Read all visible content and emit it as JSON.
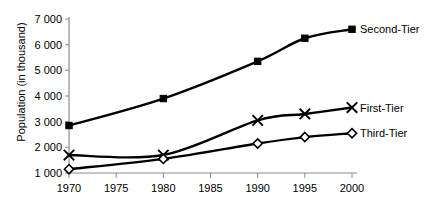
{
  "chart_data": {
    "type": "line",
    "title": "",
    "xlabel": "",
    "ylabel": "Population (in thousand)",
    "x": [
      1970,
      1975,
      1980,
      1985,
      1990,
      1995,
      2000
    ],
    "xticklabels": [
      "1970",
      "1975",
      "1980",
      "1985",
      "1990",
      "1995",
      "2000"
    ],
    "yticks": [
      1000,
      2000,
      3000,
      4000,
      5000,
      6000,
      7000
    ],
    "yticklabels": [
      "1 000",
      "2 000",
      "3 000",
      "4 000",
      "5 000",
      "6 000",
      "7 000"
    ],
    "xlim": [
      1970,
      2000
    ],
    "ylim": [
      1000,
      7000
    ],
    "grid": false,
    "legend_position": "right-inline-end-of-line",
    "series": [
      {
        "name": "Second-Tier",
        "label": "Second-Tier",
        "marker": "square",
        "color": "#000000",
        "x": [
          1970,
          1980,
          1990,
          1995,
          2000
        ],
        "values": [
          2850,
          3900,
          5350,
          6250,
          6600
        ]
      },
      {
        "name": "First-Tier",
        "label": "First-Tier",
        "marker": "cross",
        "color": "#000000",
        "x": [
          1970,
          1980,
          1990,
          1995,
          2000
        ],
        "values": [
          1700,
          1700,
          3050,
          3300,
          3550
        ]
      },
      {
        "name": "Third-Tier",
        "label": "Third-Tier",
        "marker": "diamond",
        "color": "#000000",
        "x": [
          1970,
          1980,
          1990,
          1995,
          2000
        ],
        "values": [
          1150,
          1550,
          2150,
          2400,
          2550
        ]
      }
    ]
  }
}
